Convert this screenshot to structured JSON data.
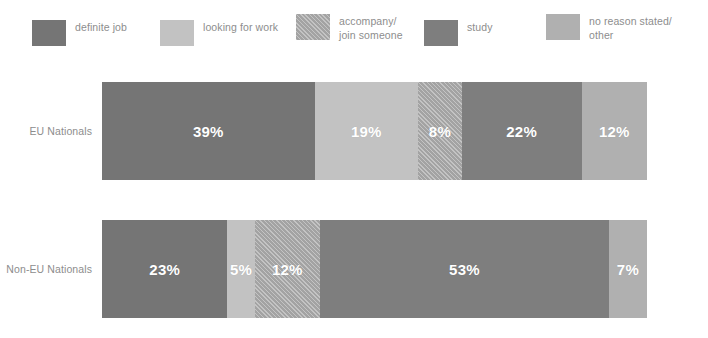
{
  "legend": {
    "items": [
      {
        "label": "definite job",
        "color": "#757575",
        "pattern": "solid",
        "icon": "legend-swatch-icon"
      },
      {
        "label": "looking for work",
        "color": "#c2c2c2",
        "pattern": "solid",
        "icon": "legend-swatch-icon"
      },
      {
        "label": "accompany/\njoin someone",
        "color": "#aaaaaa",
        "pattern": "hatch",
        "icon": "legend-swatch-icon"
      },
      {
        "label": "study",
        "color": "#7e7e7e",
        "pattern": "solid",
        "icon": "legend-swatch-icon"
      },
      {
        "label": "no reason stated/\nother",
        "color": "#b0b0b0",
        "pattern": "solid",
        "icon": "legend-swatch-icon"
      }
    ]
  },
  "chart_data": {
    "type": "bar",
    "orientation": "horizontal",
    "stacked": true,
    "stack_total": 100,
    "unit": "%",
    "title": "",
    "subtitle": "",
    "xlabel": "",
    "ylabel": "",
    "xlim": [
      0,
      100
    ],
    "grid": false,
    "legend_position": "top",
    "categories": [
      "EU Nationals",
      "Non-EU Nationals"
    ],
    "series": [
      {
        "name": "definite job",
        "color": "#757575",
        "pattern": "solid",
        "values": [
          39,
          23
        ]
      },
      {
        "name": "looking for work",
        "color": "#c2c2c2",
        "pattern": "solid",
        "values": [
          19,
          5
        ]
      },
      {
        "name": "accompany/join someone",
        "color": "#aaaaaa",
        "pattern": "hatch",
        "values": [
          8,
          12
        ]
      },
      {
        "name": "study",
        "color": "#7e7e7e",
        "pattern": "solid",
        "values": [
          22,
          53
        ]
      },
      {
        "name": "no reason stated/other",
        "color": "#b0b0b0",
        "pattern": "solid",
        "values": [
          12,
          7
        ]
      }
    ],
    "bars": [
      {
        "category": "EU Nationals",
        "segments": [
          {
            "series": "definite job",
            "value": 39,
            "label": "39%",
            "color": "#757575",
            "pattern": "solid"
          },
          {
            "series": "looking for work",
            "value": 19,
            "label": "19%",
            "color": "#c2c2c2",
            "pattern": "solid"
          },
          {
            "series": "accompany/join someone",
            "value": 8,
            "label": "8%",
            "color": "#aaaaaa",
            "pattern": "hatch"
          },
          {
            "series": "study",
            "value": 22,
            "label": "22%",
            "color": "#7e7e7e",
            "pattern": "solid"
          },
          {
            "series": "no reason stated/other",
            "value": 12,
            "label": "12%",
            "color": "#b0b0b0",
            "pattern": "solid"
          }
        ]
      },
      {
        "category": "Non-EU Nationals",
        "segments": [
          {
            "series": "definite job",
            "value": 23,
            "label": "23%",
            "color": "#757575",
            "pattern": "solid"
          },
          {
            "series": "looking for work",
            "value": 5,
            "label": "5%",
            "color": "#c2c2c2",
            "pattern": "solid"
          },
          {
            "series": "accompany/join someone",
            "value": 12,
            "label": "12%",
            "color": "#aaaaaa",
            "pattern": "hatch"
          },
          {
            "series": "study",
            "value": 53,
            "label": "53%",
            "color": "#7e7e7e",
            "pattern": "solid"
          },
          {
            "series": "no reason stated/other",
            "value": 7,
            "label": "7%",
            "color": "#b0b0b0",
            "pattern": "solid"
          }
        ]
      }
    ],
    "axis_labels": [
      "EU Nationals",
      "Non-EU Nationals"
    ],
    "colors": {
      "definite_job": "#757575",
      "looking_for_work": "#c2c2c2",
      "accompany_join_someone": "#aaaaaa",
      "study": "#7e7e7e",
      "no_reason_stated_other": "#b0b0b0",
      "label_text": "#8d8d8d",
      "value_text": "#ffffff",
      "background": "#ffffff"
    }
  }
}
